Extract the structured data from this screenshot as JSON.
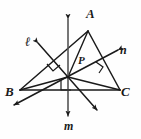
{
  "figure": {
    "background_color": "#fefefe",
    "stroke_color": "#1a1a1a",
    "labels": {
      "vertex_a": "A",
      "vertex_b": "B",
      "vertex_c": "C",
      "line_l": "ℓ",
      "line_n": "n",
      "line_m": "m",
      "point_p": "P"
    },
    "vertices": {
      "A": {
        "x": 88,
        "y": 31
      },
      "B": {
        "x": 20,
        "y": 90
      },
      "C": {
        "x": 120,
        "y": 90
      },
      "P": {
        "x": 68,
        "y": 77
      }
    },
    "lines": [
      {
        "name": "ℓ",
        "from": {
          "x": 38,
          "y": 43
        },
        "to": {
          "x": 97,
          "y": 110
        },
        "arrows": "both"
      },
      {
        "name": "n",
        "from": {
          "x": 118,
          "y": 50
        },
        "to": {
          "x": 14,
          "y": 105
        },
        "arrows": "both"
      },
      {
        "name": "m",
        "from": {
          "x": 68,
          "y": 19
        },
        "to": {
          "x": 68,
          "y": 116
        },
        "arrows": "both"
      }
    ],
    "right_angle_marks": [
      {
        "name": "right-angle-on-ab",
        "x": 53,
        "y": 68
      },
      {
        "name": "right-angle-on-ac",
        "x": 100,
        "y": 67
      },
      {
        "name": "right-angle-on-bc",
        "x": 65,
        "y": 85
      }
    ],
    "segments_from_p": [
      {
        "to_vertex": "A"
      },
      {
        "to_vertex": "B"
      },
      {
        "to_vertex": "C"
      }
    ]
  }
}
